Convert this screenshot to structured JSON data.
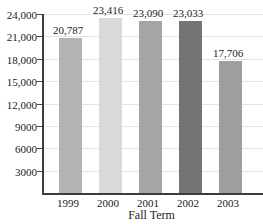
{
  "chart_data": {
    "type": "bar",
    "title": "",
    "xlabel": "Fall Term",
    "ylabel": "",
    "categories": [
      "1999",
      "2000",
      "2001",
      "2002",
      "2003"
    ],
    "values": [
      20787,
      23416,
      23090,
      23033,
      17706
    ],
    "value_labels": [
      "20,787",
      "23,416",
      "23,090",
      "23,033",
      "17,706"
    ],
    "ylim": [
      0,
      24000
    ],
    "ytick_step": 3000,
    "ytick_labels": [
      "3000",
      "6000",
      "9000",
      "12,000",
      "15,000",
      "18,000",
      "21,000",
      "24,000"
    ],
    "grid": "horizontal",
    "legend": "none",
    "bar_colors": [
      "#b3b3b3",
      "#d9d9d9",
      "#a5a5a5",
      "#747474",
      "#9e9e9e"
    ],
    "axis_color": "#3c3c3c",
    "grid_color": "#e4e4e4",
    "text_color": "#222222",
    "background_color": "#ffffff"
  }
}
